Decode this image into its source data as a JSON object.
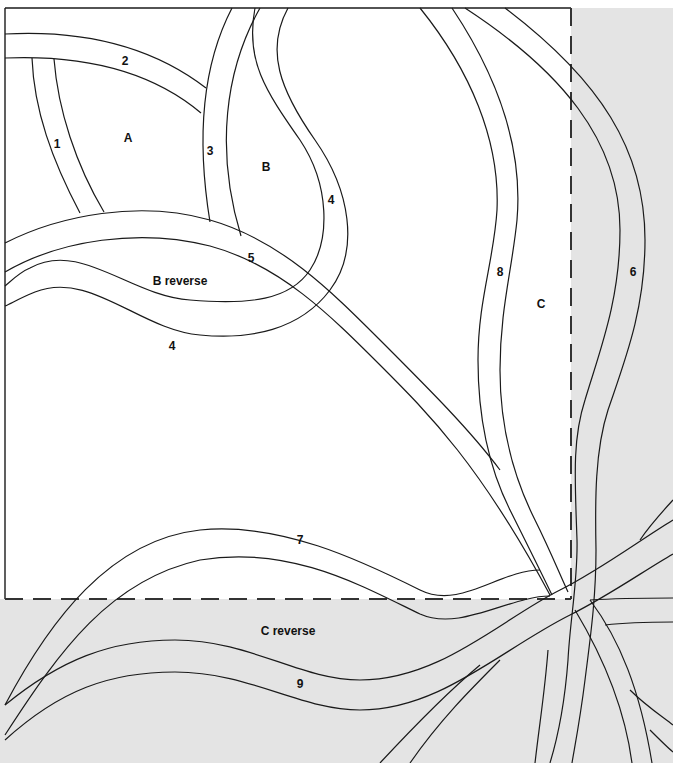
{
  "diagram": {
    "type": "quilt-pattern-template",
    "colors": {
      "background": "#ffffff",
      "shaded_area": "#e4e4e4",
      "line": "#1a1a1a",
      "text": "#111111"
    },
    "regions": [
      {
        "id": "A",
        "label": "A"
      },
      {
        "id": "B",
        "label": "B"
      },
      {
        "id": "B_reverse",
        "label": "B reverse"
      },
      {
        "id": "C",
        "label": "C"
      },
      {
        "id": "C_reverse",
        "label": "C reverse"
      }
    ],
    "strips": [
      {
        "number": "1"
      },
      {
        "number": "2"
      },
      {
        "number": "3"
      },
      {
        "number": "4"
      },
      {
        "number": "4"
      },
      {
        "number": "5"
      },
      {
        "number": "6"
      },
      {
        "number": "7"
      },
      {
        "number": "8"
      },
      {
        "number": "9"
      }
    ],
    "outline": {
      "solid_edges": [
        "top",
        "left"
      ],
      "dashed_edges": [
        "right",
        "bottom"
      ]
    }
  }
}
